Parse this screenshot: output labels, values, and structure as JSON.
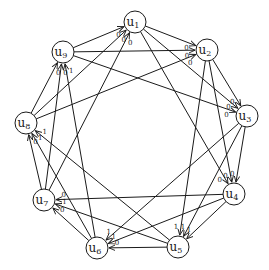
{
  "diagram": {
    "type": "directed-graph",
    "nodes": [
      {
        "id": "u1",
        "base": "u",
        "sub": "1",
        "x": 135,
        "y": 22
      },
      {
        "id": "u2",
        "base": "u",
        "sub": "2",
        "x": 207,
        "y": 50
      },
      {
        "id": "u3",
        "base": "u",
        "sub": "3",
        "x": 247,
        "y": 116
      },
      {
        "id": "u4",
        "base": "u",
        "sub": "4",
        "x": 234,
        "y": 194
      },
      {
        "id": "u5",
        "base": "u",
        "sub": "5",
        "x": 178,
        "y": 247
      },
      {
        "id": "u6",
        "base": "u",
        "sub": "6",
        "x": 97,
        "y": 248
      },
      {
        "id": "u7",
        "base": "u",
        "sub": "7",
        "x": 44,
        "y": 200
      },
      {
        "id": "u8",
        "base": "u",
        "sub": "8",
        "x": 26,
        "y": 123
      },
      {
        "id": "u9",
        "base": "u",
        "sub": "9",
        "x": 63,
        "y": 52
      }
    ],
    "edges": [
      {
        "from": "u7",
        "to": "u1",
        "label": "0"
      },
      {
        "from": "u8",
        "to": "u1",
        "label": "0"
      },
      {
        "from": "u9",
        "to": "u1",
        "label": "0"
      },
      {
        "from": "u1",
        "to": "u2",
        "label": "0"
      },
      {
        "from": "u9",
        "to": "u2",
        "label": "0"
      },
      {
        "from": "u8",
        "to": "u2",
        "label": "0"
      },
      {
        "from": "u2",
        "to": "u3",
        "label": "0"
      },
      {
        "from": "u1",
        "to": "u3",
        "label": "0"
      },
      {
        "from": "u9",
        "to": "u3",
        "label": "0"
      },
      {
        "from": "u1",
        "to": "u4",
        "label": "0"
      },
      {
        "from": "u2",
        "to": "u4",
        "label": "0"
      },
      {
        "from": "u3",
        "to": "u4",
        "label": "0"
      },
      {
        "from": "u2",
        "to": "u5",
        "label": "1"
      },
      {
        "from": "u3",
        "to": "u5",
        "label": "1"
      },
      {
        "from": "u4",
        "to": "u5",
        "label": "1"
      },
      {
        "from": "u3",
        "to": "u6",
        "label": "1"
      },
      {
        "from": "u4",
        "to": "u6",
        "label": "1"
      },
      {
        "from": "u5",
        "to": "u6",
        "label": "0"
      },
      {
        "from": "u4",
        "to": "u7",
        "label": "0"
      },
      {
        "from": "u5",
        "to": "u7",
        "label": "1"
      },
      {
        "from": "u6",
        "to": "u7",
        "label": "0"
      },
      {
        "from": "u7",
        "to": "u8",
        "label": "0"
      },
      {
        "from": "u6",
        "to": "u8",
        "label": "1"
      },
      {
        "from": "u5",
        "to": "u8",
        "label": "1"
      },
      {
        "from": "u8",
        "to": "u9",
        "label": "0"
      },
      {
        "from": "u7",
        "to": "u9",
        "label": "0"
      },
      {
        "from": "u6",
        "to": "u9",
        "label": "1"
      }
    ]
  }
}
